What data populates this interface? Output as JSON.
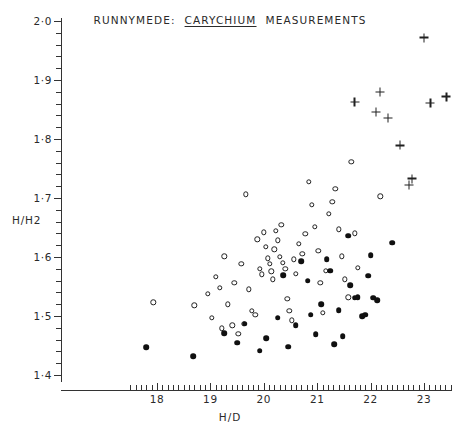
{
  "title": {
    "prefix": "RUNNYMEDE:",
    "emphasis": "CARYCHIUM",
    "suffix": "MEASUREMENTS",
    "full": "RUNNYMEDE: CARYCHIUM MEASUREMENTS"
  },
  "chart_data": {
    "type": "scatter",
    "xlabel": "H/D",
    "ylabel": "H/H2",
    "xlim": [
      17.5,
      23.7
    ],
    "ylim": [
      1.4,
      2.0
    ],
    "xticks": [
      18,
      19,
      20,
      21,
      22,
      23
    ],
    "xticklabels": [
      "18",
      "19",
      "20",
      "21",
      "22",
      "23"
    ],
    "yticks": [
      1.4,
      1.5,
      1.6,
      1.7,
      1.8,
      1.9,
      2.0
    ],
    "yticklabels": [
      "1·4",
      "1·5",
      "1·6",
      "1·7",
      "1·8",
      "1·9",
      "2·0"
    ],
    "xtick_minor_step": 0.1,
    "ytick_minor_step": 0.02,
    "grid": false,
    "legend": "none",
    "series": [
      {
        "name": "open-circle",
        "marker": "open circle",
        "color": "#202020",
        "points": [
          [
            17.93,
            1.523
          ],
          [
            18.7,
            1.518
          ],
          [
            18.95,
            1.538
          ],
          [
            19.03,
            1.497
          ],
          [
            19.1,
            1.566
          ],
          [
            19.18,
            1.548
          ],
          [
            19.21,
            1.479
          ],
          [
            19.26,
            1.601
          ],
          [
            19.33,
            1.52
          ],
          [
            19.41,
            1.484
          ],
          [
            19.45,
            1.556
          ],
          [
            19.52,
            1.47
          ],
          [
            19.58,
            1.588
          ],
          [
            19.62,
            1.487
          ],
          [
            19.66,
            1.706
          ],
          [
            19.72,
            1.545
          ],
          [
            19.78,
            1.509
          ],
          [
            19.84,
            1.502
          ],
          [
            19.88,
            1.63
          ],
          [
            19.92,
            1.58
          ],
          [
            19.96,
            1.571
          ],
          [
            20.0,
            1.642
          ],
          [
            20.04,
            1.617
          ],
          [
            20.07,
            1.598
          ],
          [
            20.11,
            1.588
          ],
          [
            20.14,
            1.576
          ],
          [
            20.17,
            1.562
          ],
          [
            20.2,
            1.613
          ],
          [
            20.23,
            1.644
          ],
          [
            20.26,
            1.628
          ],
          [
            20.3,
            1.6
          ],
          [
            20.33,
            1.655
          ],
          [
            20.36,
            1.59
          ],
          [
            20.4,
            1.58
          ],
          [
            20.44,
            1.529
          ],
          [
            20.48,
            1.509
          ],
          [
            20.52,
            1.493
          ],
          [
            20.56,
            1.596
          ],
          [
            20.6,
            1.572
          ],
          [
            20.66,
            1.622
          ],
          [
            20.72,
            1.605
          ],
          [
            20.78,
            1.639
          ],
          [
            20.84,
            1.727
          ],
          [
            20.9,
            1.688
          ],
          [
            20.96,
            1.651
          ],
          [
            21.02,
            1.61
          ],
          [
            21.06,
            1.556
          ],
          [
            21.1,
            1.505
          ],
          [
            21.16,
            1.577
          ],
          [
            21.22,
            1.673
          ],
          [
            21.28,
            1.694
          ],
          [
            21.34,
            1.716
          ],
          [
            21.4,
            1.647
          ],
          [
            21.46,
            1.601
          ],
          [
            21.52,
            1.562
          ],
          [
            21.58,
            1.532
          ],
          [
            21.64,
            1.761
          ],
          [
            21.7,
            1.64
          ],
          [
            21.76,
            1.582
          ],
          [
            22.18,
            1.703
          ]
        ]
      },
      {
        "name": "filled-circle",
        "marker": "filled circle",
        "color": "#101010",
        "points": [
          [
            17.8,
            1.447
          ],
          [
            18.68,
            1.432
          ],
          [
            19.26,
            1.471
          ],
          [
            19.5,
            1.455
          ],
          [
            19.64,
            1.487
          ],
          [
            19.92,
            1.441
          ],
          [
            20.04,
            1.462
          ],
          [
            20.26,
            1.497
          ],
          [
            20.36,
            1.569
          ],
          [
            20.46,
            1.448
          ],
          [
            20.6,
            1.484
          ],
          [
            20.7,
            1.593
          ],
          [
            20.82,
            1.56
          ],
          [
            20.88,
            1.502
          ],
          [
            20.97,
            1.469
          ],
          [
            21.08,
            1.52
          ],
          [
            21.18,
            1.596
          ],
          [
            21.24,
            1.577
          ],
          [
            21.32,
            1.452
          ],
          [
            21.4,
            1.51
          ],
          [
            21.48,
            1.466
          ],
          [
            21.58,
            1.636
          ],
          [
            21.62,
            1.552
          ],
          [
            21.7,
            1.531
          ],
          [
            21.76,
            1.532
          ],
          [
            21.84,
            1.5
          ],
          [
            21.9,
            1.502
          ],
          [
            21.95,
            1.568
          ],
          [
            22.0,
            1.603
          ],
          [
            22.05,
            1.531
          ],
          [
            22.12,
            1.527
          ],
          [
            22.4,
            1.624
          ]
        ]
      },
      {
        "name": "plus",
        "marker": "plus",
        "color": "#202020",
        "points": [
          [
            21.7,
            1.863
          ],
          [
            22.1,
            1.846
          ],
          [
            22.18,
            1.88
          ],
          [
            22.32,
            1.836
          ],
          [
            22.55,
            1.789
          ],
          [
            22.72,
            1.722
          ],
          [
            22.78,
            1.733
          ],
          [
            23.0,
            1.972
          ],
          [
            23.12,
            1.861
          ],
          [
            23.42,
            1.872
          ]
        ]
      }
    ]
  }
}
